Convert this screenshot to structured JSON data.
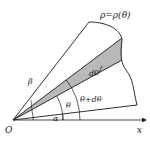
{
  "diagram": {
    "labels": {
      "curve": "ρ=ρ(θ)",
      "origin": "O",
      "x_axis": "x",
      "alpha": "α",
      "beta": "β",
      "theta": "θ",
      "theta_plus_dtheta": "θ+dθ",
      "dtheta": "dθ"
    },
    "colors": {
      "stroke": "#1a1a1a",
      "shade": "#b8b8b8",
      "background": "#ffffff"
    }
  }
}
